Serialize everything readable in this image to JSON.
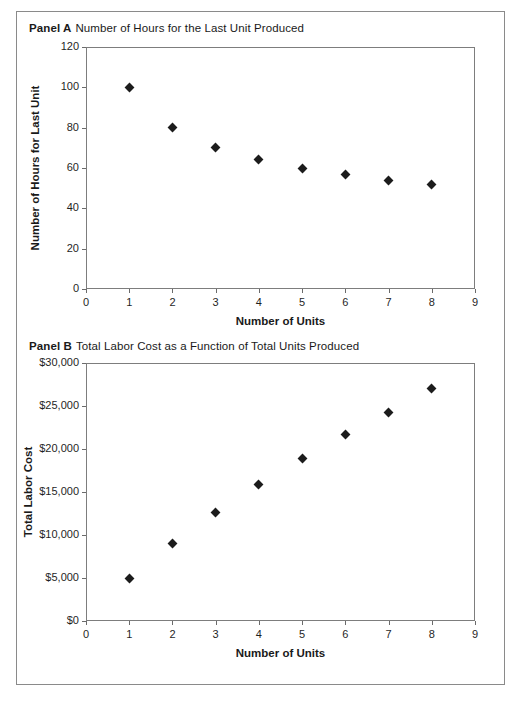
{
  "figure": {
    "panel_a": {
      "label": "Panel A",
      "description": "Number of Hours for the Last Unit Produced"
    },
    "panel_b": {
      "label": "Panel B",
      "description": "Total Labor Cost as a Function of Total Units Produced"
    }
  },
  "chart_data": [
    {
      "type": "scatter",
      "panel": "Panel A",
      "title": "Number of Hours for the Last Unit Produced",
      "xlabel": "Number of Units",
      "ylabel": "Number of Hours for Last Unit",
      "x": [
        1,
        2,
        3,
        4,
        5,
        6,
        7,
        8
      ],
      "values": [
        100,
        80,
        70,
        64,
        60,
        57,
        54,
        52
      ],
      "xlim": [
        0,
        9
      ],
      "ylim": [
        0,
        120
      ],
      "xticks": [
        0,
        1,
        2,
        3,
        4,
        5,
        6,
        7,
        8,
        9
      ],
      "xticklabels": [
        "0",
        "1",
        "2",
        "3",
        "4",
        "5",
        "6",
        "7",
        "8",
        "9"
      ],
      "yticks": [
        0,
        20,
        40,
        60,
        80,
        100,
        120
      ],
      "yticklabels": [
        "0",
        "20",
        "40",
        "60",
        "80",
        "100",
        "120"
      ],
      "grid": false,
      "legend": false,
      "marker": "diamond",
      "marker_color": "#1c1c1c"
    },
    {
      "type": "scatter",
      "panel": "Panel B",
      "title": "Total Labor Cost as a Function of Total Units Produced",
      "xlabel": "Number of Units",
      "ylabel": "Total Labor Cost",
      "x": [
        1,
        2,
        3,
        4,
        5,
        6,
        7,
        8
      ],
      "values": [
        5000,
        9000,
        12600,
        15900,
        18900,
        21700,
        24300,
        27000
      ],
      "xlim": [
        0,
        9
      ],
      "ylim": [
        0,
        30000
      ],
      "xticks": [
        0,
        1,
        2,
        3,
        4,
        5,
        6,
        7,
        8,
        9
      ],
      "xticklabels": [
        "0",
        "1",
        "2",
        "3",
        "4",
        "5",
        "6",
        "7",
        "8",
        "9"
      ],
      "yticks": [
        0,
        5000,
        10000,
        15000,
        20000,
        25000,
        30000
      ],
      "yticklabels": [
        "$0",
        "$5,000",
        "$10,000",
        "$15,000",
        "$20,000",
        "$25,000",
        "$30,000"
      ],
      "grid": false,
      "legend": false,
      "marker": "diamond",
      "marker_color": "#1c1c1c"
    }
  ]
}
